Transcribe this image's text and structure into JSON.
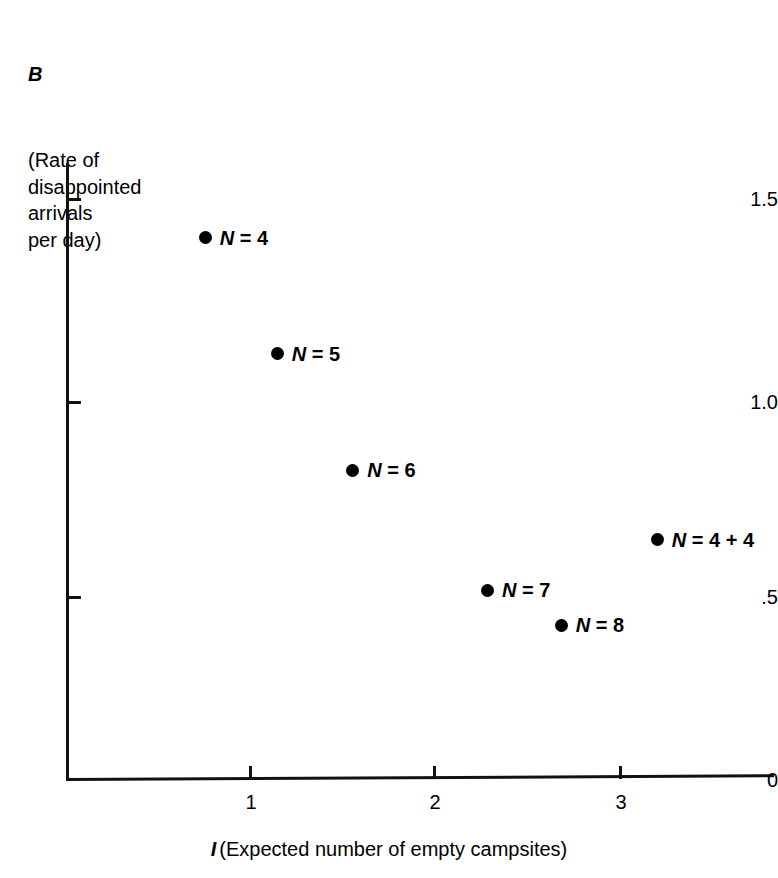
{
  "chart_data": {
    "type": "scatter",
    "title": "",
    "ylabel_symbol": "B",
    "ylabel_desc": "(Rate of\ndisappointed\narrivals\nper day)",
    "xlabel_symbol": "I",
    "xlabel_desc": "(Expected number of empty campsites)",
    "xlim": [
      0,
      3.45
    ],
    "ylim": [
      0,
      1.6
    ],
    "xticks": [
      "1",
      "2",
      "3"
    ],
    "xtick_values": [
      1,
      2,
      3
    ],
    "yticks": [
      "1.5",
      "1.0",
      ".5",
      "0"
    ],
    "ytick_values": [
      1.5,
      1.0,
      0.5,
      0
    ],
    "grid": false,
    "legend": "none",
    "marker_color": "#000000",
    "axis_color": "#111111",
    "points": [
      {
        "label": "N = 4",
        "label_prefix": "N",
        "label_suffix": "= 4",
        "x": 0.76,
        "y": 1.4
      },
      {
        "label": "N = 5",
        "label_prefix": "N",
        "label_suffix": "= 5",
        "x": 1.15,
        "y": 1.1
      },
      {
        "label": "N = 6",
        "label_prefix": "N",
        "label_suffix": "= 6",
        "x": 1.56,
        "y": 0.8
      },
      {
        "label": "N = 4 + 4",
        "label_prefix": "N",
        "label_suffix": "= 4 + 4",
        "x": 3.21,
        "y": 0.62
      },
      {
        "label": "N = 7",
        "label_prefix": "N",
        "label_suffix": "= 7",
        "x": 2.29,
        "y": 0.49
      },
      {
        "label": "N = 8",
        "label_prefix": "N",
        "label_suffix": "= 8",
        "x": 2.69,
        "y": 0.4
      }
    ]
  }
}
